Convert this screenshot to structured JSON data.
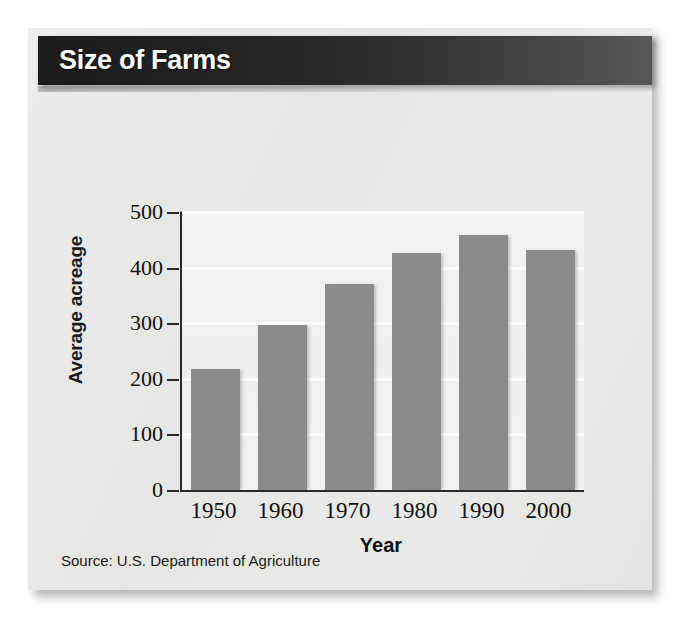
{
  "figure": {
    "title": "Size of Farms",
    "source_note": "Source: U.S. Department of Agriculture"
  },
  "colors": {
    "bar": "#8b8b8b",
    "header_dark": "#1b1b1b",
    "header_light": "#585858",
    "plot_background": "#f1f1ef",
    "gridline": "#fdfdfc",
    "axis": "#2a2a2a",
    "card_background": "#e9e9e7"
  },
  "chart_data": {
    "type": "bar",
    "title": "Size of Farms",
    "xlabel": "Year",
    "ylabel": "Average acreage",
    "categories": [
      "1950",
      "1960",
      "1970",
      "1980",
      "1990",
      "2000"
    ],
    "values": [
      218,
      297,
      370,
      427,
      458,
      432
    ],
    "ylim": [
      0,
      500
    ],
    "yticks": [
      0,
      100,
      200,
      300,
      400,
      500
    ],
    "ytick_labels": [
      "0",
      "100",
      "200",
      "300",
      "400",
      "500"
    ],
    "grid": true,
    "grid_axis": "y",
    "legend": false,
    "legend_position": "none",
    "series": [
      {
        "name": "Average acreage",
        "values": [
          218,
          297,
          370,
          427,
          458,
          432
        ]
      }
    ],
    "annotations": [
      "Source: U.S. Department of Agriculture"
    ]
  }
}
